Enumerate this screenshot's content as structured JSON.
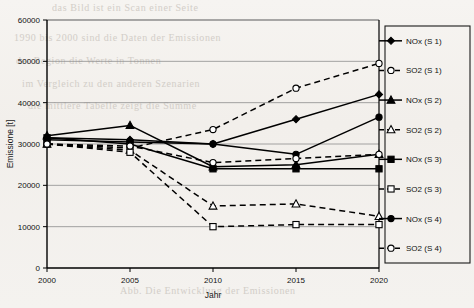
{
  "chart_data": {
    "type": "line",
    "title": "",
    "xlabel": "Jahr",
    "ylabel": "Emissione [t]",
    "x": [
      2000,
      2005,
      2010,
      2015,
      2020
    ],
    "xtick_labels": [
      "2000",
      "2005",
      "2010",
      "2015",
      "2020"
    ],
    "ytick_labels": [
      "0",
      "10000",
      "20000",
      "30000",
      "40000",
      "50000",
      "60000"
    ],
    "yticks": [
      0,
      10000,
      20000,
      30000,
      40000,
      50000,
      60000
    ],
    "ylim": [
      0,
      60000
    ],
    "xlim": [
      2000,
      2020
    ],
    "grid": true,
    "legend_position": "right",
    "series": [
      {
        "name": "NOx (S 1)",
        "marker": "filled-diamond",
        "linestyle": "solid",
        "values": [
          31500,
          31000,
          30000,
          36000,
          42000
        ]
      },
      {
        "name": "SO2 (S 1)",
        "marker": "open-circle",
        "linestyle": "dashed",
        "values": [
          30000,
          29000,
          33500,
          43500,
          49500
        ]
      },
      {
        "name": "NOx (S 2)",
        "marker": "filled-triangle",
        "linestyle": "solid",
        "values": [
          32000,
          34500,
          24500,
          25000,
          27500
        ]
      },
      {
        "name": "SO2 (S 2)",
        "marker": "open-triangle",
        "linestyle": "dashed",
        "values": [
          30000,
          28500,
          15000,
          15500,
          12500
        ]
      },
      {
        "name": "NOx (S 3)",
        "marker": "filled-square",
        "linestyle": "solid",
        "values": [
          31500,
          30000,
          24000,
          24000,
          24000
        ]
      },
      {
        "name": "SO2 (S 3)",
        "marker": "open-square",
        "linestyle": "dashed",
        "values": [
          30000,
          28000,
          10000,
          10500,
          10500
        ]
      },
      {
        "name": "NOx (S 4)",
        "marker": "filled-circle",
        "linestyle": "solid",
        "values": [
          31000,
          30500,
          30000,
          27500,
          36500
        ]
      },
      {
        "name": "SO2 (S 4)",
        "marker": "open-circle",
        "linestyle": "dashed",
        "values": [
          30000,
          29500,
          25500,
          26500,
          27500
        ]
      }
    ]
  },
  "legend": {
    "items": [
      {
        "label": "NOx (S 1)"
      },
      {
        "label": "SO2 (S 1)"
      },
      {
        "label": "NOx (S 2)"
      },
      {
        "label": "SO2 (S 2)"
      },
      {
        "label": "NOx (S 3)"
      },
      {
        "label": "SO2 (S 3)"
      },
      {
        "label": "NOx (S 4)"
      },
      {
        "label": "SO2 (S 4)"
      }
    ]
  },
  "colors": {
    "line": "#000000",
    "grid": "#8d8d8d",
    "axis": "#000000",
    "background": "#f4f2ef",
    "text": "#111111"
  },
  "background_text": {
    "line1": "das  Bild  ist  ein  Scan  einer  Seite",
    "line2": "1990  bis  2000   sind  die  Daten  der  Emissionen",
    "line3": "der  Region  die  Werte  in  Tonnen",
    "line4": "im  Vergleich  zu  den  anderen  Szenarien",
    "line5": "die  mittlere  Tabelle  zeigt  die  Summe",
    "line6": "Abb.  Die  Entwicklung  der  Emissionen"
  }
}
